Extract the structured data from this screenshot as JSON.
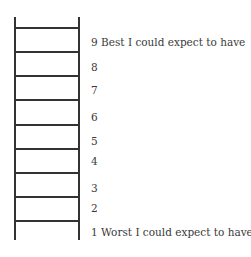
{
  "diagram": {
    "type": "ladder-scale",
    "rungs_y": [
      27,
      51,
      75,
      99,
      124,
      148,
      172,
      196,
      220
    ],
    "labels": [
      {
        "text": "9 Best I could expect to have",
        "y": 36
      },
      {
        "text": "8",
        "y": 61
      },
      {
        "text": "7",
        "y": 84
      },
      {
        "text": "6",
        "y": 111
      },
      {
        "text": "5",
        "y": 135
      },
      {
        "text": "4",
        "y": 155
      },
      {
        "text": "3",
        "y": 182
      },
      {
        "text": "2",
        "y": 202
      },
      {
        "text": "1 Worst I could expect to have",
        "y": 226
      }
    ]
  }
}
